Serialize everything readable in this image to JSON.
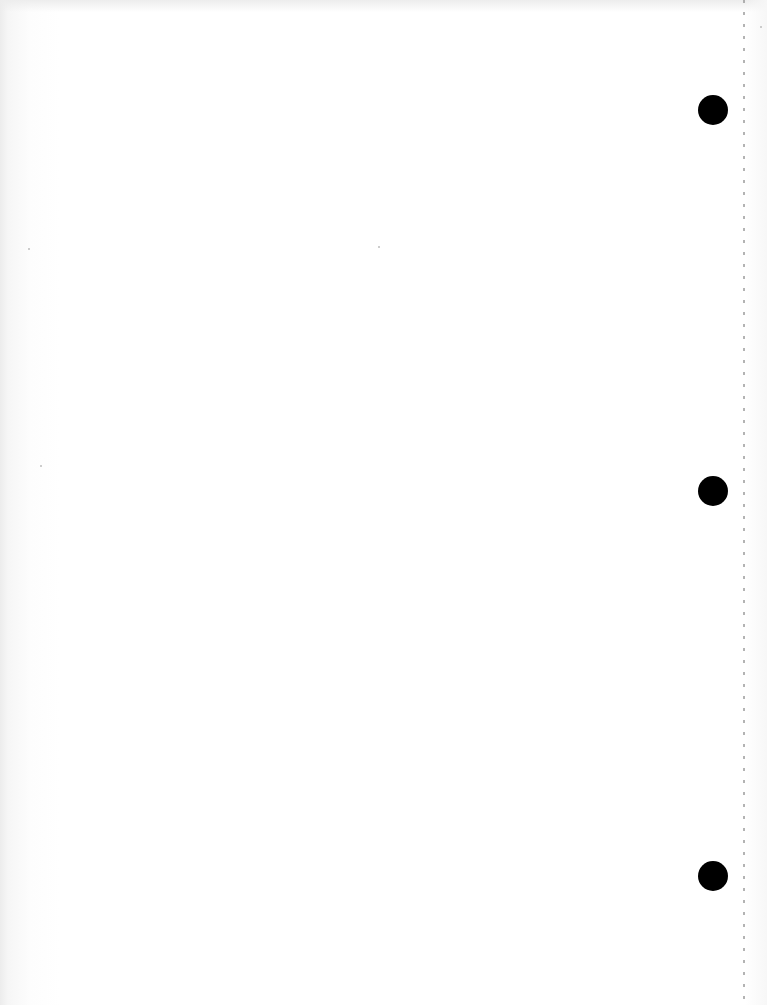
{
  "document": {
    "type": "blank-scanned-page",
    "text_content": "",
    "background_color": "#ffffff",
    "punch_holes": [
      {
        "cx": 713,
        "cy": 110,
        "r": 15,
        "color": "#000000"
      },
      {
        "cx": 713,
        "cy": 491,
        "r": 15,
        "color": "#000000"
      },
      {
        "cx": 713,
        "cy": 876,
        "r": 15,
        "color": "#000000"
      }
    ],
    "perforation_line": {
      "x": 744,
      "style": "dotted",
      "color": "#9a9a9a"
    }
  }
}
